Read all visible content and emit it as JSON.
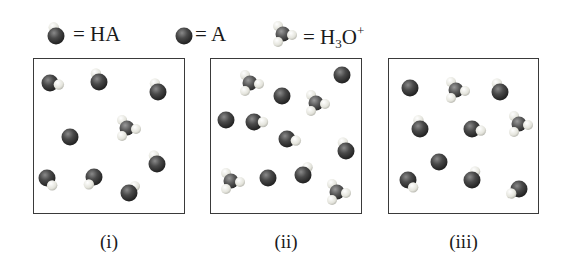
{
  "legend": {
    "items": [
      {
        "symbol": "HA-molecule",
        "text": "= HA",
        "x": 50,
        "y": 36
      },
      {
        "symbol": "A-molecule",
        "text": "= A",
        "x": 178,
        "y": 36
      },
      {
        "symbol": "H3O-molecule",
        "text_main": "= H",
        "text_sub": "3",
        "text_o": "O",
        "text_sup": "+",
        "x": 283,
        "y": 36
      }
    ]
  },
  "colors": {
    "heavy_atom": "#3c3c3c",
    "hydrogen": "#e8e8e0",
    "border": "#3a3a3a"
  },
  "panels": [
    {
      "label": "(i)",
      "box": {
        "x": 33,
        "y": 58,
        "w": 152,
        "h": 156
      },
      "molecules": [
        {
          "type": "HA",
          "x": 50,
          "y": 83,
          "h_angle": 10
        },
        {
          "type": "HA",
          "x": 99,
          "y": 82,
          "h_angle": -110
        },
        {
          "type": "HA",
          "x": 158,
          "y": 92,
          "h_angle": -110
        },
        {
          "type": "A",
          "x": 70,
          "y": 137
        },
        {
          "type": "H3O",
          "x": 127,
          "y": 128
        },
        {
          "type": "HA",
          "x": 157,
          "y": 164,
          "h_angle": -110
        },
        {
          "type": "HA",
          "x": 47,
          "y": 178,
          "h_angle": 55
        },
        {
          "type": "HA",
          "x": 94,
          "y": 177,
          "h_angle": 125
        },
        {
          "type": "HA",
          "x": 129,
          "y": 193,
          "h_angle": -50
        }
      ]
    },
    {
      "label": "(ii)",
      "box": {
        "x": 210,
        "y": 58,
        "w": 152,
        "h": 156
      },
      "molecules": [
        {
          "type": "H3O",
          "x": 250,
          "y": 83
        },
        {
          "type": "A",
          "x": 282,
          "y": 96
        },
        {
          "type": "A",
          "x": 342,
          "y": 75
        },
        {
          "type": "H3O",
          "x": 316,
          "y": 103
        },
        {
          "type": "A",
          "x": 226,
          "y": 120
        },
        {
          "type": "HA",
          "x": 254,
          "y": 122,
          "h_angle": 0
        },
        {
          "type": "HA",
          "x": 287,
          "y": 139,
          "h_angle": 10
        },
        {
          "type": "HA",
          "x": 346,
          "y": 151,
          "h_angle": -110
        },
        {
          "type": "H3O",
          "x": 231,
          "y": 181
        },
        {
          "type": "A",
          "x": 268,
          "y": 178
        },
        {
          "type": "HA",
          "x": 303,
          "y": 175,
          "h_angle": -60
        },
        {
          "type": "H3O",
          "x": 337,
          "y": 192
        }
      ]
    },
    {
      "label": "(iii)",
      "box": {
        "x": 388,
        "y": 58,
        "w": 151,
        "h": 156
      },
      "molecules": [
        {
          "type": "A",
          "x": 410,
          "y": 88
        },
        {
          "type": "H3O",
          "x": 456,
          "y": 90
        },
        {
          "type": "HA",
          "x": 500,
          "y": 92,
          "h_angle": -110
        },
        {
          "type": "HA",
          "x": 420,
          "y": 129,
          "h_angle": -100
        },
        {
          "type": "HA",
          "x": 472,
          "y": 129,
          "h_angle": 10
        },
        {
          "type": "H3O",
          "x": 519,
          "y": 124
        },
        {
          "type": "A",
          "x": 439,
          "y": 162
        },
        {
          "type": "HA",
          "x": 408,
          "y": 180,
          "h_angle": 55
        },
        {
          "type": "HA",
          "x": 472,
          "y": 180,
          "h_angle": -70
        },
        {
          "type": "HA",
          "x": 519,
          "y": 189,
          "h_angle": 150
        }
      ]
    }
  ],
  "panel_labels_y": 232
}
